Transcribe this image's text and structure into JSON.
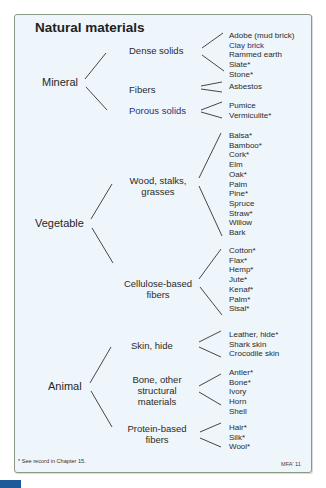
{
  "title": "Natural materials",
  "categories": [
    {
      "name": "Mineral",
      "groups": [
        {
          "name": "Dense solids",
          "items": [
            "Adobe (mud brick)",
            "Clay brick",
            "Rammed earth",
            "Slate*",
            "Stone*"
          ]
        },
        {
          "name": "Fibers",
          "items": [
            "Asbestos"
          ]
        },
        {
          "name": "Porous solids",
          "items": [
            "Pumice",
            "Vermiculite*"
          ]
        }
      ]
    },
    {
      "name": "Vegetable",
      "groups": [
        {
          "name_lines": [
            "Wood, stalks,",
            "grasses"
          ],
          "items": [
            "Balsa*",
            "Bamboo*",
            "Cork*",
            "Elm",
            "Oak*",
            "Palm",
            "Pine*",
            "Spruce",
            "Straw*",
            "Willow",
            "Bark"
          ]
        },
        {
          "name_lines": [
            "Cellulose-based",
            "fibers"
          ],
          "items": [
            "Cotton*",
            "Flax*",
            "Hemp*",
            "Jute*",
            "Kenaf*",
            "Palm*",
            "Sisal*"
          ]
        }
      ]
    },
    {
      "name": "Animal",
      "groups": [
        {
          "name": "Skin, hide",
          "items": [
            "Leather, hide*",
            "Shark skin",
            "Crocodile skin"
          ]
        },
        {
          "name_lines": [
            "Bone, other",
            "structural",
            "materials"
          ],
          "items": [
            "Antler*",
            "Bone*",
            "Ivory",
            "Horn",
            "Shell"
          ]
        },
        {
          "name_lines": [
            "Protein-based",
            "fibers"
          ],
          "items": [
            "Hair*",
            "Silk*",
            "Wool*"
          ]
        }
      ]
    }
  ],
  "footnote": "* See record in Chapter 15.",
  "credit": "MFA' 11"
}
